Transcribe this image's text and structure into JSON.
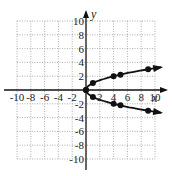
{
  "chart_data": {
    "type": "line",
    "title": "",
    "xlabel": "x",
    "ylabel": "y",
    "xlim": [
      -10,
      10
    ],
    "ylim": [
      -10,
      10
    ],
    "grid": true,
    "x_ticks": [
      "-10",
      "-8",
      "-6",
      "-4",
      "-2",
      "2",
      "4",
      "6",
      "8",
      "10"
    ],
    "y_ticks": [
      "10",
      "8",
      "6",
      "4",
      "2",
      "-2",
      "-4",
      "-6",
      "-8",
      "-10"
    ],
    "series": [
      {
        "name": "upper branch",
        "points": [
          [
            0,
            0
          ],
          [
            1,
            1
          ],
          [
            4,
            2
          ],
          [
            5,
            2.2
          ],
          [
            9,
            3
          ]
        ],
        "arrow_end": true
      },
      {
        "name": "lower branch",
        "points": [
          [
            0,
            0
          ],
          [
            1,
            -1
          ],
          [
            4,
            -2
          ],
          [
            5,
            -2.2
          ],
          [
            9,
            -3
          ]
        ],
        "arrow_end": true
      }
    ],
    "curve": "x = y^2 (parabola opening right)"
  }
}
